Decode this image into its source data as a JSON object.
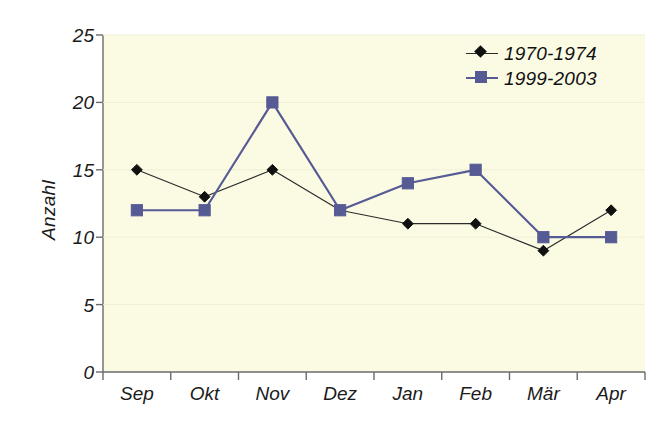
{
  "chart_data": {
    "type": "line",
    "title": "",
    "xlabel": "",
    "ylabel": "Anzahl",
    "categories": [
      "Sep",
      "Okt",
      "Nov",
      "Dez",
      "Jan",
      "Feb",
      "Mär",
      "Apr"
    ],
    "ylim": [
      0,
      25
    ],
    "yticks": [
      0,
      5,
      10,
      15,
      20,
      25
    ],
    "grid": false,
    "legend_position": "top-right",
    "series": [
      {
        "name": "1970-1974",
        "marker": "diamond",
        "color": "#101010",
        "line_color": "#2b2b2b",
        "values": [
          15,
          13,
          15,
          12,
          11,
          11,
          9,
          12
        ]
      },
      {
        "name": "1999-2003",
        "marker": "square",
        "color": "#565b94",
        "line_color": "#565b94",
        "values": [
          12,
          12,
          20,
          12,
          14,
          15,
          10,
          10
        ]
      }
    ],
    "plot_background": "#fbfbe4",
    "axis_color": "#6b6b6b",
    "page_background": "#ffffff"
  },
  "axis": {
    "y_labels": [
      "25",
      "20",
      "15",
      "10",
      "5",
      "0"
    ],
    "y_title": "Anzahl"
  },
  "legend": {
    "items": [
      {
        "label": "1970-1974",
        "marker": "diamond-marker",
        "color": "#101010"
      },
      {
        "label": "1999-2003",
        "marker": "square-marker",
        "color": "#565b94"
      }
    ]
  }
}
